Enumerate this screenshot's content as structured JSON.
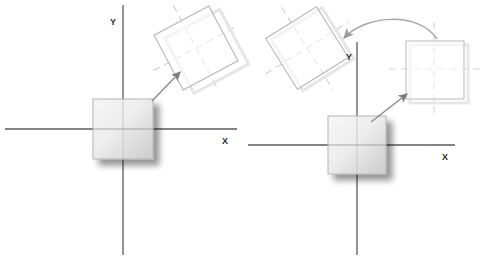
{
  "figure": {
    "background_color": "#ffffff",
    "width": 486,
    "height": 262,
    "panels": [
      {
        "id": "left-panel",
        "name": "rotation-about-origin",
        "axes": {
          "x_label": "X",
          "y_label": "Y",
          "color": "#5a5a5a",
          "origin": {
            "x": 123,
            "y": 129
          },
          "x_axis": {
            "x1": 5,
            "y1": 129,
            "x2": 237,
            "y2": 129
          },
          "y_axis": {
            "x1": 123,
            "y1": 5,
            "x2": 123,
            "y2": 255
          },
          "x_label_pos": {
            "x": 224,
            "y": 141
          },
          "y_label_pos": {
            "x": 114,
            "y": 22
          }
        },
        "source_square": {
          "name": "solid-square",
          "center": {
            "x": 123,
            "y": 129
          },
          "size": 60,
          "rotation_deg": 0,
          "fill_start": "#f2f2f2",
          "fill_end": "#c9c9c9",
          "stroke": "#b0b0b0",
          "shadow": "#bdbdbd"
        },
        "target_square": {
          "name": "rotated-outline-square",
          "center": {
            "x": 196,
            "y": 48
          },
          "size": 62,
          "rotation_deg": -28,
          "fill": "none",
          "stroke": "#b9b9b9",
          "shadow": "#e0e0e0",
          "cross_color": "#cfcfcf",
          "cross_style": "dashed"
        },
        "arrow": {
          "name": "rotation-arrow",
          "from": {
            "x": 153,
            "y": 100
          },
          "to": {
            "x": 181,
            "y": 71
          },
          "color": "#8e8e8e",
          "style": "straight"
        }
      },
      {
        "id": "right-panel",
        "name": "translate-then-rotate",
        "axes": {
          "x_label": "X",
          "y_label": "Y",
          "color": "#5a5a5a",
          "origin": {
            "x": 357,
            "y": 145
          },
          "x_axis": {
            "x1": 248,
            "y1": 145,
            "x2": 455,
            "y2": 145
          },
          "y_axis": {
            "x1": 357,
            "y1": 42,
            "x2": 357,
            "y2": 255
          },
          "x_label_pos": {
            "x": 444,
            "y": 157
          },
          "y_label_pos": {
            "x": 349,
            "y": 57
          }
        },
        "source_square": {
          "name": "solid-square",
          "center": {
            "x": 357,
            "y": 145
          },
          "size": 58,
          "rotation_deg": 0,
          "fill_start": "#f2f2f2",
          "fill_end": "#c9c9c9",
          "stroke": "#b0b0b0",
          "shadow": "#bdbdbd"
        },
        "translated_square": {
          "name": "translated-outline-square",
          "center": {
            "x": 434,
            "y": 69
          },
          "size": 58,
          "rotation_deg": 0,
          "fill": "none",
          "stroke": "#c2c2c2",
          "shadow": "#e4e4e4",
          "cross_color": "#d2d2d2",
          "cross_style": "dashed"
        },
        "rotated_square": {
          "name": "rotated-outline-square",
          "center": {
            "x": 307,
            "y": 48
          },
          "size": 60,
          "rotation_deg": -32,
          "fill": "none",
          "stroke": "#bbbbbb",
          "shadow": "#e0e0e0",
          "cross_color": "#cfcfcf",
          "cross_style": "dashed"
        },
        "translate_arrow": {
          "name": "translation-arrow",
          "from": {
            "x": 372,
            "y": 121
          },
          "to": {
            "x": 408,
            "y": 93
          },
          "color": "#8e8e8e",
          "style": "straight"
        },
        "rotate_arrow": {
          "name": "rotation-arrow",
          "from": {
            "x": 432,
            "y": 36
          },
          "to": {
            "x": 343,
            "y": 38
          },
          "control": {
            "x": 392,
            "y": 10
          },
          "color": "#a6a6a6",
          "style": "curved"
        }
      }
    ]
  }
}
